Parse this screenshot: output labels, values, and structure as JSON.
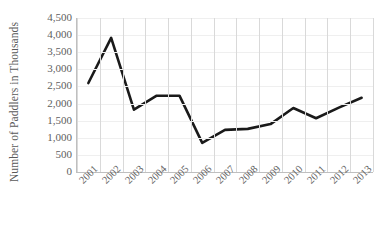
{
  "chart_data": {
    "type": "line",
    "title": "",
    "xlabel": "",
    "ylabel": "Number of Paddlers in Thousands",
    "categories": [
      "2001",
      "2002",
      "2003",
      "2004",
      "2005",
      "2006",
      "2007",
      "2008",
      "2009",
      "2010",
      "2011",
      "2012",
      "2013"
    ],
    "values": [
      2600,
      3920,
      1820,
      2230,
      2230,
      850,
      1230,
      1260,
      1400,
      1870,
      1570,
      1880,
      2170
    ],
    "series": [
      {
        "name": "Number of Paddlers in Thousands",
        "values": [
          2600,
          3920,
          1820,
          2230,
          2230,
          850,
          1230,
          1260,
          1400,
          1870,
          1570,
          1880,
          2170
        ]
      }
    ],
    "ylim": [
      0,
      4500
    ],
    "ytick_values": [
      0,
      500,
      1000,
      1500,
      2000,
      2500,
      3000,
      3500,
      4000,
      4500
    ],
    "ytick_labels": [
      "0",
      "500",
      "1,000",
      "1,500",
      "2,000",
      "2,500",
      "3,000",
      "3,500",
      "4,000",
      "4,500"
    ],
    "xtick_labels": [
      "2001",
      "2002",
      "2003",
      "2004",
      "2005",
      "2006",
      "2007",
      "2008",
      "2009",
      "2010",
      "2011",
      "2012",
      "2013"
    ],
    "xtick_rotation": -45,
    "grid": {
      "vertical": true,
      "horizontal": true
    },
    "legend": {
      "visible": false,
      "position": "none"
    },
    "line_color": "#1a1a1a",
    "line_width": 2.6,
    "markers": false,
    "grid_color": "#d9d9d9",
    "axis_color": "#bfbfbf",
    "text_color": "#5e5e5e",
    "background": "#ffffff"
  }
}
